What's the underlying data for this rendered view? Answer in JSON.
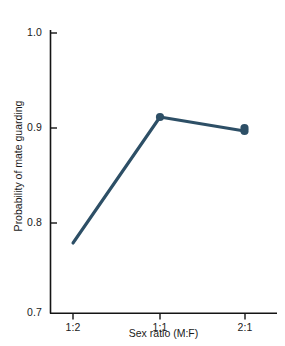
{
  "chart_data": {
    "type": "line",
    "title": "",
    "xlabel": "Sex ratio (M:F)",
    "ylabel": "Probability of mate guarding",
    "categories": [
      "1:2",
      "1:1",
      "2:1"
    ],
    "values": [
      0.775,
      0.91,
      0.895
    ],
    "series": [
      {
        "name": "Probability of mate guarding",
        "values": [
          0.775,
          0.91,
          0.895
        ]
      }
    ],
    "ylim": [
      0.7,
      1.0
    ],
    "yticks": [
      "0.7",
      "0.8",
      "0.9",
      "1.0"
    ],
    "ytick_values": [
      0.7,
      0.8,
      0.9,
      1.0
    ],
    "xticks": [
      "1:2",
      "1:1",
      "2:1"
    ],
    "grid": false,
    "legend": "none",
    "marker": "filled-circle",
    "line_color": "#2d4f66",
    "marker_color": "#2d4f66",
    "axis_color": "#141414",
    "background_color": "#ffffff"
  }
}
